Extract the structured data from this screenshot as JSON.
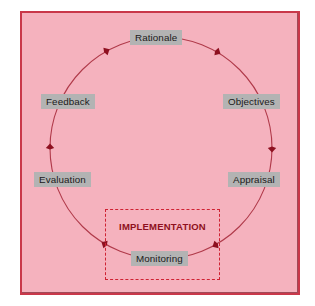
{
  "diagram": {
    "type": "cyclical-process-diagram",
    "background_color": "#f5b2be",
    "frame_border_color": "#c9384a",
    "node_chip_color": "#b3b3b3",
    "arrow_color": "#b03a4a",
    "emphasis_color": "#8e1020",
    "dashed_box_color": "#cf2233",
    "direction": "clockwise",
    "nodes": [
      {
        "id": "rationale",
        "label": "Rationale",
        "angle_deg": 270
      },
      {
        "id": "objectives",
        "label": "Objectives",
        "angle_deg": 330
      },
      {
        "id": "appraisal",
        "label": "Appraisal",
        "angle_deg": 30
      },
      {
        "id": "monitoring",
        "label": "Monitoring",
        "angle_deg": 90
      },
      {
        "id": "evaluation",
        "label": "Evaluation",
        "angle_deg": 150
      },
      {
        "id": "feedback",
        "label": "Feedback",
        "angle_deg": 210
      }
    ],
    "grouping_box": {
      "label": "IMPLEMENTATION",
      "style": "dashed",
      "encloses": [
        "monitoring"
      ]
    },
    "arrowheads": [
      {
        "at_angle_deg": 300,
        "x": 237,
        "y": 67
      },
      {
        "at_angle_deg": 0,
        "x": 272,
        "y": 145
      },
      {
        "at_angle_deg": 60,
        "x": 242,
        "y": 227
      },
      {
        "at_angle_deg": 120,
        "x": 78,
        "y": 228
      },
      {
        "at_angle_deg": 180,
        "x": 51,
        "y": 149
      },
      {
        "at_angle_deg": 240,
        "x": 80,
        "y": 70
      }
    ]
  }
}
